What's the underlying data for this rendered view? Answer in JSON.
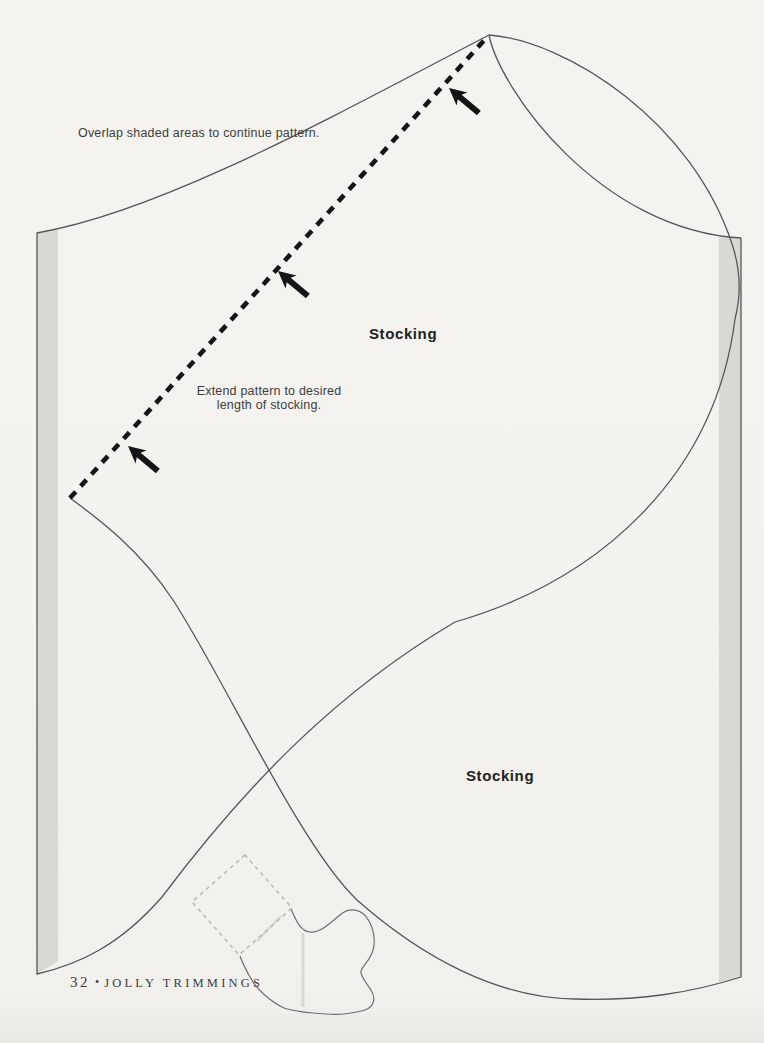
{
  "annotations": {
    "overlap_note": "Overlap shaded areas to continue pattern.",
    "extend_note": [
      "Extend pattern to desired",
      "length of stocking."
    ]
  },
  "pattern_pieces": [
    {
      "label": "Stocking"
    },
    {
      "label": "Stocking"
    }
  ],
  "footer": {
    "page_number": "32",
    "separator": "•",
    "book_title": "JOLLY TRIMMINGS"
  },
  "colors": {
    "page_background": "#f3f2ee",
    "outline": "#565656",
    "shaded_area": "#d9d8d2",
    "dashed_cut_line": "#151515",
    "arrow": "#151515",
    "text": "#3d3d3d",
    "mini_dash": "#bcbbb4",
    "mini_outline": "#6e6e6e",
    "mini_light_line": "#d9d8d2"
  },
  "icons": {
    "extend_arrow": "extend-direction-arrow"
  }
}
